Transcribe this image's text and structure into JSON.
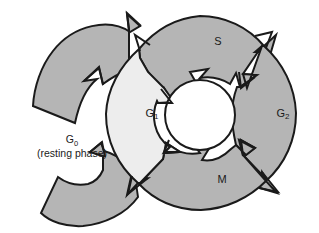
{
  "figure": {
    "name": "cell-cycle-diagram",
    "background_color": "#ffffff",
    "outline_color": "#1a1a1a"
  },
  "colors": {
    "dark_gray_fill": "#b5b5b5",
    "light_gray_fill": "#ededed",
    "inner_hole_fill": "#ffffff",
    "outline": "#1a1a1a"
  },
  "phases": [
    {
      "id": "g1",
      "label": "G",
      "subscript": "1",
      "fill": "#ededed",
      "label_x": 152,
      "label_y": 114
    },
    {
      "id": "s",
      "label": "S",
      "subscript": "",
      "fill": "#b5b5b5",
      "label_x": 218,
      "label_y": 42
    },
    {
      "id": "g2",
      "label": "G",
      "subscript": "2",
      "fill": "#b5b5b5",
      "label_x": 283,
      "label_y": 114
    },
    {
      "id": "m",
      "label": "M",
      "subscript": "",
      "fill": "#b5b5b5",
      "label_x": 222,
      "label_y": 180
    }
  ],
  "resting_phase": {
    "id": "g0",
    "label": "G",
    "subscript": "0",
    "caption": "(resting phase)",
    "fill": "#b5b5b5",
    "label_x": 72,
    "label_y": 140,
    "caption_x": 72,
    "caption_y": 155
  },
  "geometry": {
    "main_center_x": 200,
    "main_center_y": 114,
    "outer_radius": 98,
    "inner_radius": 36,
    "g0_center_x": 110,
    "g0_center_y": 120,
    "g0_outer_radius": 96,
    "g0_inner_radius": 42
  }
}
